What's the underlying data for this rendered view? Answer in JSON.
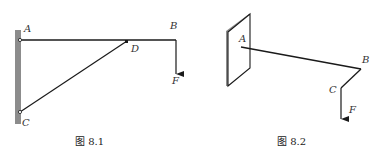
{
  "figures": [
    {
      "id": "fig-8-1",
      "caption": "图 8.1",
      "labels": {
        "A": "A",
        "B": "B",
        "C": "C",
        "D": "D",
        "F": "F"
      },
      "description": "Horizontal beam AB pinned to wall at A, supported by strut CD from wall point C to D; downward force F at B"
    },
    {
      "id": "fig-8-2",
      "caption": "图 8.2",
      "labels": {
        "A": "A",
        "B": "B",
        "C": "C",
        "F": "F"
      },
      "description": "Bent bar ABC fixed to a plate (wall) at A in 3D view; downward force F at C"
    }
  ],
  "colors": {
    "line": "#1a1a1a",
    "wall": "#8c8c8c",
    "background": "#ffffff"
  }
}
